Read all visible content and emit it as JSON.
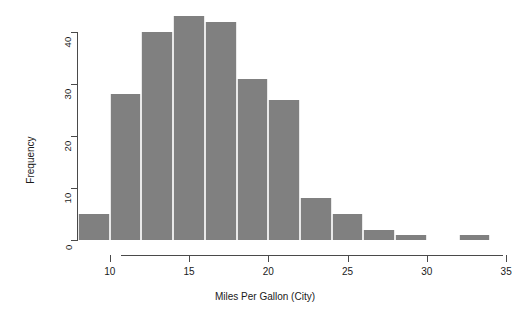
{
  "chart_data": {
    "type": "bar",
    "title": "",
    "xlabel": "Miles Per Gallon (City)",
    "ylabel": "Frequency",
    "xlim": [
      8,
      36
    ],
    "ylim": [
      0,
      44
    ],
    "grid": false,
    "legend": null,
    "bin_width": 2,
    "bin_edges": [
      8,
      10,
      12,
      14,
      16,
      18,
      20,
      22,
      24,
      26,
      28,
      30,
      32,
      34
    ],
    "categories": [
      "8-10",
      "10-12",
      "12-14",
      "14-16",
      "16-18",
      "18-20",
      "20-22",
      "22-24",
      "24-26",
      "26-28",
      "28-30",
      "30-32",
      "32-34"
    ],
    "values": [
      5,
      28,
      40,
      43,
      42,
      31,
      27,
      8,
      5,
      2,
      1,
      0,
      1
    ],
    "xticks": [
      10,
      15,
      20,
      25,
      30,
      35
    ],
    "xtick_labels": [
      "10",
      "15",
      "20",
      "25",
      "30",
      "35"
    ],
    "yticks": [
      0,
      10,
      20,
      30,
      40
    ],
    "ytick_labels": [
      "0",
      "10",
      "20",
      "30",
      "40"
    ],
    "bar_color": "#808080",
    "bar_border_color": "#e9e9e9",
    "axis_color": "#4a4a4a",
    "background": "#ffffff"
  }
}
